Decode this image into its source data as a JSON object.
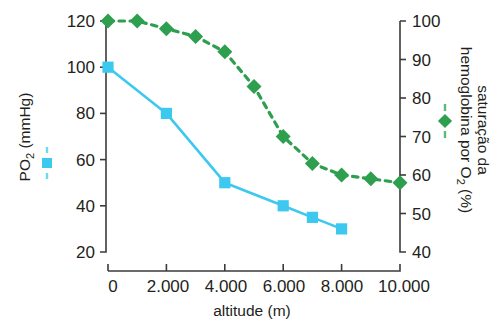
{
  "chart_data": {
    "type": "line",
    "title": "",
    "xlabel": "altitude (m)",
    "x": [
      0,
      1000,
      2000,
      3000,
      4000,
      5000,
      6000,
      7000,
      8000,
      9000,
      10000
    ],
    "xlim": [
      0,
      10000
    ],
    "xticks": [
      0,
      2000,
      4000,
      6000,
      8000,
      10000
    ],
    "xtick_labels": [
      "0",
      "2.000",
      "4.000",
      "6.000",
      "8.000",
      "10.000"
    ],
    "grid": false,
    "legend_position": "axis-labels",
    "axes": [
      {
        "id": "left",
        "ylabel": "PO2 (mmHg)",
        "ylabel_main": "PO",
        "ylabel_sub": "2",
        "ylabel_tail": " (mmHg)",
        "ylim": [
          20,
          120
        ],
        "yticks": [
          20,
          40,
          60,
          80,
          100,
          120
        ],
        "ytick_labels": [
          "20",
          "40",
          "60",
          "80",
          "100",
          "120"
        ]
      },
      {
        "id": "right",
        "ylabel": "saturacao da hemoglobina por O2 (%)",
        "ylabel_part1": "saturação da",
        "ylabel_part2": "hemoglobina por O",
        "ylabel_sub": "2",
        "ylabel_tail": " (%)",
        "ylim": [
          40,
          100
        ],
        "yticks": [
          40,
          50,
          60,
          70,
          80,
          90,
          100
        ],
        "ytick_labels": [
          "40",
          "50",
          "60",
          "70",
          "80",
          "90",
          "100"
        ]
      }
    ],
    "series": [
      {
        "name": "PO2 (mmHg)",
        "axis": "left",
        "color": "#3cc8ef",
        "marker": "square",
        "linestyle": "solid",
        "x": [
          0,
          2000,
          4000,
          6000,
          7000,
          8000
        ],
        "values": [
          100,
          80,
          50,
          40,
          35,
          30
        ]
      },
      {
        "name": "saturacao da hemoglobina por O2 (%)",
        "axis": "right",
        "color": "#2e9e4f",
        "marker": "diamond",
        "linestyle": "dashed",
        "x": [
          0,
          1000,
          2000,
          3000,
          4000,
          5000,
          6000,
          7000,
          8000,
          9000,
          10000
        ],
        "values": [
          100,
          100,
          98,
          96,
          92,
          83,
          70,
          63,
          60,
          59,
          58
        ]
      }
    ]
  },
  "figure": {
    "xaxis_label": "altitude (m)",
    "left_axis": {
      "label_main": "PO",
      "label_sub": "2",
      "label_tail": " (mmHg)",
      "ticks": [
        "120",
        "100",
        "80",
        "60",
        "40",
        "20"
      ],
      "legend_color": "#3cc8ef",
      "legend_marker": "square-marker"
    },
    "right_axis": {
      "label_line1": "saturação da",
      "label_line2_main": "hemoglobina por O",
      "label_line2_sub": "2",
      "label_line2_tail": " (%)",
      "ticks": [
        "100",
        "90",
        "80",
        "70",
        "60",
        "50",
        "40"
      ],
      "legend_color": "#2e9e4f",
      "legend_marker": "diamond-marker"
    },
    "xticks": [
      "0",
      "2.000",
      "4.000",
      "6.000",
      "8.000",
      "10.000"
    ]
  }
}
